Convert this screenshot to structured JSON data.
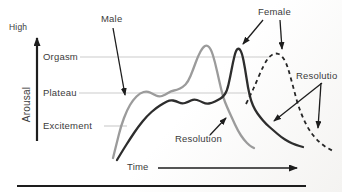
{
  "figure": {
    "title_semantic": "Sexual response cycle diagram (arousal over time, male and female patterns)",
    "labels": {
      "high": "High",
      "arousal": "Arousal",
      "orgasm": "Orgasm",
      "plateau": "Plateau",
      "excitement": "Excitement",
      "male": "Male",
      "female": "Female",
      "resolution_male": "Resolution",
      "resolution_female": "Resolutio",
      "time": "Time"
    },
    "colors": {
      "male_curve": "#9b9b9b",
      "female_solid_curve": "#2d2d2d",
      "female_dashed_curve": "#262626",
      "gridline": "#cbcbcb",
      "ink": "#1d1d1d",
      "text": "#3b3b3b"
    },
    "gridlines": {
      "orgasm": {
        "y": 57,
        "x1": 80,
        "x2": 270
      },
      "plateau": {
        "y": 93,
        "x1": 79,
        "x2": 247
      },
      "excitement": {
        "y": 126,
        "x1": 104,
        "x2": 127
      }
    },
    "arrows": {
      "y_axis": {
        "x1": 37,
        "y1": 141,
        "x2": 37,
        "y2": 38,
        "w": 2.2,
        "big": true
      },
      "time": {
        "x1": 158,
        "y1": 168,
        "x2": 297,
        "y2": 168,
        "w": 1.4,
        "big": true
      },
      "male": {
        "x1": 113,
        "y1": 28,
        "x2": 125,
        "y2": 95,
        "w": 1.3
      },
      "female_a": {
        "x1": 263,
        "y1": 20,
        "x2": 243,
        "y2": 44,
        "w": 1.3
      },
      "female_b": {
        "x1": 280,
        "y1": 20,
        "x2": 282,
        "y2": 49,
        "w": 1.3
      },
      "res_f1": {
        "x1": 322,
        "y1": 83,
        "x2": 274,
        "y2": 121,
        "w": 1.3
      },
      "res_f2": {
        "x1": 321,
        "y1": 83,
        "x2": 318,
        "y2": 128,
        "w": 1.3
      },
      "res_m": {
        "x1": 210,
        "y1": 135,
        "x2": 226,
        "y2": 118,
        "w": 1.3
      }
    },
    "divider": {
      "x1": 17,
      "y1": 186,
      "x2": 306,
      "y2": 186,
      "w": 2.2
    },
    "curves": {
      "male": {
        "color": "#9b9b9b",
        "width": 2.3,
        "points": [
          [
            113,
            158
          ],
          [
            117,
            142
          ],
          [
            121,
            126
          ],
          [
            127,
            110
          ],
          [
            133,
            100
          ],
          [
            140,
            93
          ],
          [
            147,
            91
          ],
          [
            153,
            94
          ],
          [
            159,
            97
          ],
          [
            165,
            95
          ],
          [
            171,
            91
          ],
          [
            177,
            90
          ],
          [
            183,
            87
          ],
          [
            188,
            82
          ],
          [
            193,
            70
          ],
          [
            198,
            56
          ],
          [
            203,
            47
          ],
          [
            207,
            45
          ],
          [
            211,
            49
          ],
          [
            215,
            62
          ],
          [
            219,
            80
          ],
          [
            223,
            97
          ],
          [
            227,
            107
          ],
          [
            232,
            118
          ],
          [
            238,
            131
          ],
          [
            244,
            140
          ],
          [
            250,
            146
          ],
          [
            254,
            148
          ]
        ]
      },
      "female_solid": {
        "color": "#2d2d2d",
        "width": 2.3,
        "points": [
          [
            117,
            160
          ],
          [
            123,
            150
          ],
          [
            130,
            139
          ],
          [
            138,
            127
          ],
          [
            147,
            116
          ],
          [
            156,
            108
          ],
          [
            164,
            103
          ],
          [
            170,
            100
          ],
          [
            176,
            101
          ],
          [
            182,
            104
          ],
          [
            188,
            102
          ],
          [
            194,
            99
          ],
          [
            200,
            101
          ],
          [
            206,
            104
          ],
          [
            212,
            103
          ],
          [
            218,
            100
          ],
          [
            223,
            97
          ],
          [
            227,
            91
          ],
          [
            230,
            78
          ],
          [
            233,
            62
          ],
          [
            236,
            50
          ],
          [
            239,
            48
          ],
          [
            242,
            53
          ],
          [
            245,
            68
          ],
          [
            248,
            88
          ],
          [
            251,
            101
          ],
          [
            255,
            110
          ],
          [
            260,
            117
          ],
          [
            266,
            124
          ],
          [
            273,
            130
          ],
          [
            281,
            137
          ],
          [
            289,
            142
          ],
          [
            296,
            145
          ],
          [
            303,
            147
          ]
        ]
      },
      "female_dashed": {
        "color": "#262626",
        "width": 1.8,
        "dash": "4 3.5",
        "points": [
          [
            246,
            104
          ],
          [
            251,
            94
          ],
          [
            256,
            83
          ],
          [
            261,
            71
          ],
          [
            266,
            61
          ],
          [
            271,
            55
          ],
          [
            276,
            53
          ],
          [
            281,
            55
          ],
          [
            286,
            62
          ],
          [
            290,
            75
          ],
          [
            294,
            90
          ],
          [
            298,
            105
          ],
          [
            303,
            118
          ],
          [
            309,
            130
          ],
          [
            316,
            139
          ],
          [
            324,
            146
          ],
          [
            333,
            151
          ]
        ]
      }
    }
  }
}
